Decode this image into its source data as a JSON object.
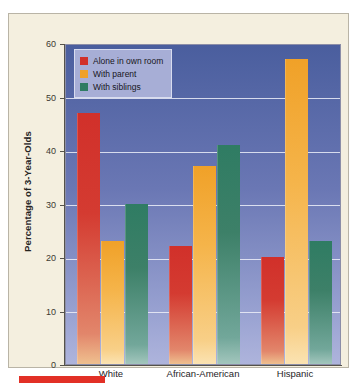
{
  "chart_data": {
    "type": "bar",
    "title": "",
    "xlabel": "",
    "ylabel": "Percentage of 3-Year-Olds",
    "ylim": [
      0,
      60
    ],
    "yticks": [
      0,
      10,
      20,
      30,
      40,
      50,
      60
    ],
    "ytick_labels": [
      "0",
      "10",
      "20",
      "30",
      "40",
      "50",
      "60"
    ],
    "grid": true,
    "legend_position": "upper-left-inside",
    "categories": [
      "White",
      "African-American",
      "Hispanic"
    ],
    "series": [
      {
        "name": "Alone in own room",
        "color": "#d1302a",
        "values": [
          47,
          22,
          20
        ]
      },
      {
        "name": "With parent",
        "color": "#f0a128",
        "values": [
          23,
          37,
          57
        ]
      },
      {
        "name": "With siblings",
        "color": "#2f7c63",
        "values": [
          30,
          41,
          23
        ]
      }
    ]
  },
  "legend": {
    "items": [
      {
        "label": "Alone in own room"
      },
      {
        "label": "With parent"
      },
      {
        "label": "With siblings"
      }
    ]
  },
  "axes": {
    "y_title": "Percentage of 3-Year-Olds",
    "y_tick_0": "0",
    "y_tick_1": "10",
    "y_tick_2": "20",
    "y_tick_3": "30",
    "y_tick_4": "40",
    "y_tick_5": "50",
    "y_tick_6": "60",
    "x_cat_0": "White",
    "x_cat_1": "African-American",
    "x_cat_2": "Hispanic"
  },
  "colors": {
    "series_alone": "#d1302a",
    "series_parent": "#f0a128",
    "series_siblings": "#2f7c63",
    "plot_background_top": "#4a5e9e",
    "plot_background_bottom": "#aeb4dc",
    "card_background": "#f4efdf",
    "footer_marker": "#e23026"
  }
}
